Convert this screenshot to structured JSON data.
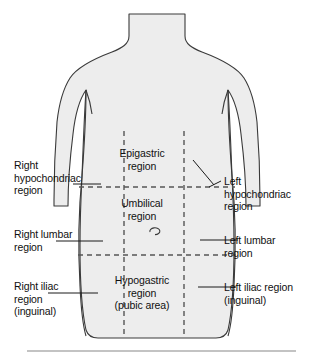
{
  "figure": {
    "body_fill": "#ededed",
    "outline_color": "#3a3a3a",
    "grid_color": "#555555",
    "rule_color": "#888888",
    "navel_icon": "navel-mark"
  },
  "region_labels": [
    {
      "id": "epigastric",
      "text": "Epigastric\nregion"
    },
    {
      "id": "umbilical",
      "text": "Umbilical\nregion"
    },
    {
      "id": "hypogastric",
      "text": "Hypogastric\nregion\n(pubic area)"
    }
  ],
  "callout_labels": [
    {
      "id": "right-hypochondriac",
      "text": "Right\nhypochondriac\nregion"
    },
    {
      "id": "right-lumbar",
      "text": "Right lumbar\nregion"
    },
    {
      "id": "right-iliac",
      "text": "Right iliac\nregion\n(inguinal)"
    },
    {
      "id": "left-hypochondriac",
      "text": "Left\nhypochondriac\nregion"
    },
    {
      "id": "left-lumbar",
      "text": "Left lumbar\nregion"
    },
    {
      "id": "left-iliac",
      "text": "Left iliac region\n(inguinal)"
    }
  ]
}
